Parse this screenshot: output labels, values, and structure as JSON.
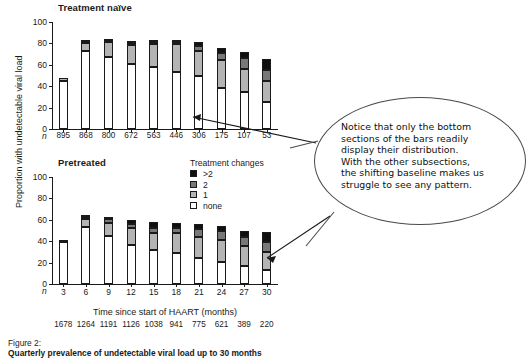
{
  "figure": {
    "caption_prefix": "Figure 2:",
    "caption_text": "Quarterly prevalence of undetectable viral load up to 30 months"
  },
  "axes": {
    "y_title": "Proportion with undetectable viral load",
    "x_title": "Time since start of HAART (months)",
    "y_ticks": [
      "0",
      "20",
      "40",
      "60",
      "80",
      "100"
    ],
    "n_marker": "n"
  },
  "legend": {
    "title": "Treatment changes",
    "items": [
      {
        "label": ">2",
        "color": "#101010"
      },
      {
        "label": "2",
        "color": "#787878"
      },
      {
        "label": "1",
        "color": "#b4b4b4"
      },
      {
        "label": "none",
        "color": "#ffffff"
      }
    ]
  },
  "callout": {
    "text": "Notice that only the bottom\nsections of the bars readily\ndisplay their distribution.\nWith the other subsections,\nthe shifting baseline makes us\nstruggle to see any pattern."
  },
  "panels": {
    "top": {
      "title": "Treatment naïve"
    },
    "bottom": {
      "title": "Pretreated"
    }
  },
  "chart_data": [
    {
      "type": "bar",
      "subtype": "stacked",
      "title": "Treatment naïve",
      "xlabel": "Time since start of HAART (months)",
      "ylabel": "Proportion with undetectable viral load",
      "ylim": [
        0,
        100
      ],
      "yticks": [
        0,
        20,
        40,
        60,
        80,
        100
      ],
      "grid": false,
      "legend": "Treatment changes",
      "legend_position": "below-right",
      "categories": [
        "3",
        "6",
        "9",
        "12",
        "15",
        "18",
        "21",
        "24",
        "27",
        "30"
      ],
      "n": [
        895,
        868,
        800,
        672,
        563,
        446,
        306,
        175,
        107,
        53
      ],
      "series": [
        {
          "name": "none",
          "color": "#ffffff",
          "values": [
            45,
            72.5,
            67,
            61,
            58,
            53,
            49.5,
            38.5,
            34.5,
            25
          ]
        },
        {
          "name": "1",
          "color": "#b4b4b4",
          "values": [
            2.5,
            8,
            14.5,
            17.5,
            21,
            26.5,
            23.5,
            26,
            22,
            20
          ]
        },
        {
          "name": "2",
          "color": "#787878",
          "values": [
            0,
            0.5,
            1,
            1.5,
            2,
            1.5,
            5,
            6.5,
            9.5,
            10
          ]
        },
        {
          "name": ">2",
          "color": "#101010",
          "values": [
            0,
            2.5,
            2,
            2,
            2.5,
            2,
            3,
            5,
            6,
            10
          ]
        }
      ],
      "totals": [
        47.5,
        83.5,
        84.5,
        82,
        83.5,
        83,
        81,
        76,
        72,
        65
      ]
    },
    {
      "type": "bar",
      "subtype": "stacked",
      "title": "Pretreated",
      "xlabel": "Time since start of HAART (months)",
      "ylabel": "Proportion with undetectable viral load",
      "ylim": [
        0,
        100
      ],
      "yticks": [
        0,
        20,
        40,
        60,
        80,
        100
      ],
      "grid": false,
      "legend": "Treatment changes",
      "legend_position": "above-right",
      "categories": [
        "3",
        "6",
        "9",
        "12",
        "15",
        "18",
        "21",
        "24",
        "27",
        "30"
      ],
      "n": [
        1678,
        1264,
        1191,
        1126,
        1038,
        941,
        775,
        621,
        389,
        220
      ],
      "series": [
        {
          "name": "none",
          "color": "#ffffff",
          "values": [
            39,
            53,
            45,
            36.5,
            31.5,
            29,
            24.5,
            21,
            16.5,
            13
          ]
        },
        {
          "name": "1",
          "color": "#b4b4b4",
          "values": [
            2.5,
            7.5,
            12,
            16,
            16,
            18.5,
            19.5,
            20.5,
            19,
            17
          ]
        },
        {
          "name": "2",
          "color": "#787878",
          "values": [
            0,
            2.5,
            3.5,
            4,
            5,
            5,
            7,
            8,
            8,
            9.5
          ]
        },
        {
          "name": ">2",
          "color": "#101010",
          "values": [
            0,
            1.5,
            2.5,
            3,
            5.5,
            4.5,
            5,
            5,
            6,
            9
          ]
        }
      ],
      "totals": [
        41.5,
        64.5,
        63,
        59.5,
        58,
        57,
        56,
        54.5,
        49.5,
        48.5
      ]
    }
  ]
}
